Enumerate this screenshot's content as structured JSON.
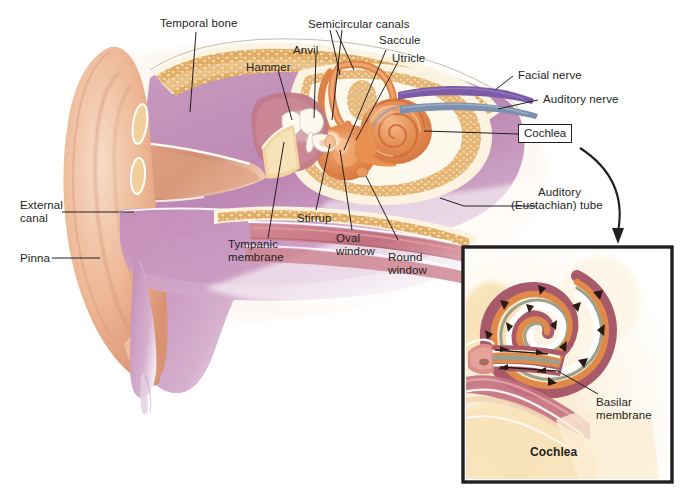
{
  "figure": {
    "background_color": "#ffffff",
    "width": 681,
    "height": 490
  },
  "palette": {
    "skin": "#edb694",
    "skin_light": "#f4d3bb",
    "skin_shadow": "#d99a78",
    "purple_tissue": "#bf8cb5",
    "purple_deep": "#a86ba0",
    "bone_tan": "#dfa85f",
    "bone_light": "#f0cf9a",
    "bone_outline": "#faf1dc",
    "cochlea_orange": "#e0854a",
    "cochlea_orange_light": "#f2b07a",
    "mucosa_rose": "#c4707e",
    "mucosa_rose_deep": "#a65264",
    "facial_nerve_purple": "#7b5aa6",
    "auditory_nerve_blue": "#7d8fae",
    "basilar_grey_green": "#9aa08c",
    "line_black": "#231f20",
    "inset_border": "#231f20"
  },
  "labels": {
    "temporal_bone": "Temporal bone",
    "semicircular_canals": "Semicircular canals",
    "anvil": "Anvil",
    "hammer": "Hammer",
    "saccule": "Saccule",
    "utricle": "Utricle",
    "facial_nerve": "Facial nerve",
    "auditory_nerve": "Auditory nerve",
    "cochlea_callout": "Cochlea",
    "auditory_tube_line1": "Auditory",
    "auditory_tube_line2": "(Eustachian) tube",
    "external_canal_line1": "External",
    "external_canal_line2": "canal",
    "pinna": "Pinna",
    "tympanic_membrane_line1": "Tympanic",
    "tympanic_membrane_line2": "membrane",
    "stirrup": "Stirrup",
    "oval_window_line1": "Oval",
    "oval_window_line2": "window",
    "round_window_line1": "Round",
    "round_window_line2": "window"
  },
  "inset": {
    "caption": "Cochlea",
    "basilar_membrane_line1": "Basilar",
    "basilar_membrane_line2": "membrane",
    "border_color": "#231f20",
    "arrow_direction": "into-inset"
  },
  "structures": [
    {
      "name": "pinna",
      "region": "outer ear",
      "color": "#edb694"
    },
    {
      "name": "external-auditory-canal",
      "region": "outer ear",
      "color": "#e8b793"
    },
    {
      "name": "tympanic-membrane",
      "region": "middle ear",
      "color": "#f0d3a0"
    },
    {
      "name": "hammer-malleus",
      "region": "middle ear",
      "color": "#fbf5e8"
    },
    {
      "name": "anvil-incus",
      "region": "middle ear",
      "color": "#fbf5e8"
    },
    {
      "name": "stirrup-stapes",
      "region": "middle ear",
      "color": "#fbf5e8"
    },
    {
      "name": "oval-window",
      "region": "middle ear",
      "color": "#e0854a"
    },
    {
      "name": "round-window",
      "region": "middle ear",
      "color": "#e0854a"
    },
    {
      "name": "semicircular-canals",
      "region": "inner ear",
      "color": "#e0854a"
    },
    {
      "name": "utricle",
      "region": "inner ear",
      "color": "#e58f55"
    },
    {
      "name": "saccule",
      "region": "inner ear",
      "color": "#e58f55"
    },
    {
      "name": "cochlea",
      "region": "inner ear",
      "color": "#e0854a"
    },
    {
      "name": "facial-nerve",
      "region": "nerves",
      "color": "#7b5aa6"
    },
    {
      "name": "auditory-nerve",
      "region": "nerves",
      "color": "#7d8fae"
    },
    {
      "name": "eustachian-tube",
      "region": "middle ear",
      "color": "#c4707e"
    },
    {
      "name": "temporal-bone",
      "region": "skull",
      "color": "#dfa85f"
    },
    {
      "name": "basilar-membrane",
      "region": "inner ear",
      "color": "#9aa08c"
    }
  ]
}
